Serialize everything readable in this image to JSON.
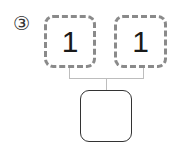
{
  "problem": {
    "label": "③",
    "top_boxes": [
      {
        "value": "1"
      },
      {
        "value": "1"
      }
    ],
    "bottom_box": {
      "value": ""
    }
  }
}
